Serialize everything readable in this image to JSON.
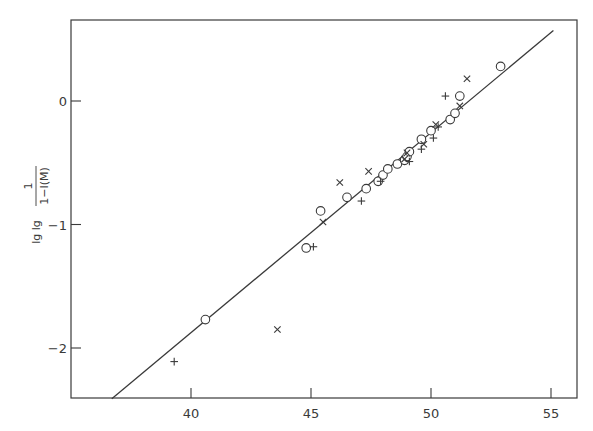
{
  "chart_data": {
    "type": "scatter",
    "title": "",
    "xlabel": "",
    "ylabel": "lg lg 1/(1−I(M))",
    "ylabel_parts": {
      "prefix": "lg lg",
      "numerator": "1",
      "denominator": "1−I(M)"
    },
    "xlim": [
      35.5,
      56
    ],
    "ylim": [
      -2.4,
      0.65
    ],
    "grid": false,
    "legend": null,
    "x_ticks": [
      40,
      45,
      50,
      55
    ],
    "x_tick_labels": [
      "40",
      "45",
      "50",
      "55"
    ],
    "y_ticks": [
      0,
      -1,
      -2
    ],
    "y_tick_labels": [
      "0",
      "−1",
      "−2"
    ],
    "fit_line": {
      "x": [
        36.7,
        55.1
      ],
      "y": [
        -2.41,
        0.57
      ]
    },
    "series": [
      {
        "name": "circles",
        "marker": "o",
        "points": [
          [
            40.6,
            -1.77
          ],
          [
            44.8,
            -1.19
          ],
          [
            45.4,
            -0.89
          ],
          [
            46.5,
            -0.78
          ],
          [
            47.3,
            -0.71
          ],
          [
            47.8,
            -0.65
          ],
          [
            48.0,
            -0.6
          ],
          [
            48.2,
            -0.55
          ],
          [
            48.6,
            -0.51
          ],
          [
            48.9,
            -0.48
          ],
          [
            49.0,
            -0.45
          ],
          [
            49.1,
            -0.41
          ],
          [
            49.6,
            -0.31
          ],
          [
            50.0,
            -0.24
          ],
          [
            50.8,
            -0.15
          ],
          [
            51.0,
            -0.1
          ],
          [
            51.2,
            0.04
          ],
          [
            52.9,
            0.28
          ]
        ]
      },
      {
        "name": "crosses",
        "marker": "x",
        "points": [
          [
            43.6,
            -1.85
          ],
          [
            45.5,
            -0.98
          ],
          [
            46.2,
            -0.66
          ],
          [
            47.4,
            -0.57
          ],
          [
            48.9,
            -0.47
          ],
          [
            49.0,
            -0.42
          ],
          [
            49.7,
            -0.35
          ],
          [
            50.2,
            -0.19
          ],
          [
            51.2,
            -0.04
          ],
          [
            51.5,
            0.18
          ]
        ]
      },
      {
        "name": "plus",
        "marker": "+",
        "points": [
          [
            39.3,
            -2.11
          ],
          [
            45.1,
            -1.18
          ],
          [
            47.1,
            -0.81
          ],
          [
            47.9,
            -0.65
          ],
          [
            49.1,
            -0.49
          ],
          [
            49.6,
            -0.39
          ],
          [
            50.1,
            -0.3
          ],
          [
            50.3,
            -0.21
          ],
          [
            50.6,
            0.04
          ]
        ]
      }
    ]
  },
  "layout": {
    "plot_px": {
      "left": 71,
      "top": 20,
      "right": 577,
      "bottom": 398
    },
    "x_px_per_unit": 24,
    "x_origin": {
      "value": 40,
      "px": 191
    },
    "y_px_per_unit": 123.5,
    "y_origin": {
      "value": 0,
      "px": 101
    },
    "ink_color": "#3a3a3a",
    "background": "#ffffff"
  }
}
